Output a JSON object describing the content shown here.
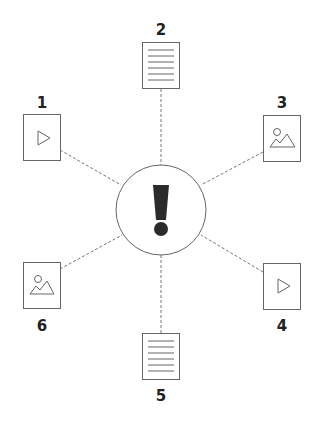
{
  "diagram": {
    "center": {
      "icon": "exclamation-icon",
      "shape": "circle"
    },
    "nodes": [
      {
        "id": 1,
        "label": "1",
        "icon": "video-play-icon",
        "type": "video"
      },
      {
        "id": 2,
        "label": "2",
        "icon": "document-lines-icon",
        "type": "document"
      },
      {
        "id": 3,
        "label": "3",
        "icon": "image-icon",
        "type": "image"
      },
      {
        "id": 4,
        "label": "4",
        "icon": "video-play-icon",
        "type": "video"
      },
      {
        "id": 5,
        "label": "5",
        "icon": "document-lines-icon",
        "type": "document"
      },
      {
        "id": 6,
        "label": "6",
        "icon": "image-icon",
        "type": "image"
      }
    ],
    "colors": {
      "stroke": "#6b6b6b",
      "text": "#222222",
      "exclamation": "#2b2b2b",
      "background": "#ffffff"
    }
  }
}
